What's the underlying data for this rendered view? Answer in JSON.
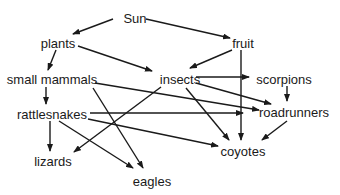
{
  "diagram": {
    "type": "food-web",
    "nodes": [
      {
        "id": "sun",
        "label": "Sun",
        "x": 135,
        "y": 18
      },
      {
        "id": "plants",
        "label": "plants",
        "x": 58,
        "y": 43
      },
      {
        "id": "fruit",
        "label": "fruit",
        "x": 243,
        "y": 43
      },
      {
        "id": "small_mammals",
        "label": "small mammals",
        "x": 52,
        "y": 79
      },
      {
        "id": "insects",
        "label": "insects",
        "x": 180,
        "y": 79
      },
      {
        "id": "scorpions",
        "label": "scorpions",
        "x": 284,
        "y": 79
      },
      {
        "id": "rattlesnakes",
        "label": "rattlesnakes",
        "x": 52,
        "y": 114
      },
      {
        "id": "roadrunners",
        "label": "roadrunners",
        "x": 294,
        "y": 112
      },
      {
        "id": "lizards",
        "label": "lizards",
        "x": 53,
        "y": 161
      },
      {
        "id": "coyotes",
        "label": "coyotes",
        "x": 243,
        "y": 151
      },
      {
        "id": "eagles",
        "label": "eagles",
        "x": 152,
        "y": 181
      }
    ],
    "edges": [
      {
        "from": "sun",
        "to": "plants",
        "x1": 113,
        "y1": 19,
        "x2": 73,
        "y2": 34
      },
      {
        "from": "sun",
        "to": "fruit",
        "x1": 146,
        "y1": 19,
        "x2": 230,
        "y2": 38
      },
      {
        "from": "plants",
        "to": "small_mammals",
        "x1": 56,
        "y1": 50,
        "x2": 48,
        "y2": 70
      },
      {
        "from": "plants",
        "to": "insects",
        "x1": 78,
        "y1": 46,
        "x2": 152,
        "y2": 71
      },
      {
        "from": "fruit",
        "to": "insects",
        "x1": 232,
        "y1": 50,
        "x2": 190,
        "y2": 68
      },
      {
        "from": "fruit",
        "to": "coyotes",
        "x1": 241,
        "y1": 50,
        "x2": 241,
        "y2": 140
      },
      {
        "from": "insects",
        "to": "scorpions",
        "x1": 196,
        "y1": 77,
        "x2": 249,
        "y2": 77
      },
      {
        "from": "insects",
        "to": "roadrunners",
        "x1": 196,
        "y1": 83,
        "x2": 271,
        "y2": 104
      },
      {
        "from": "insects",
        "to": "lizards",
        "x1": 161,
        "y1": 87,
        "x2": 74,
        "y2": 152
      },
      {
        "from": "insects",
        "to": "coyotes",
        "x1": 186,
        "y1": 88,
        "x2": 229,
        "y2": 140
      },
      {
        "from": "scorpions",
        "to": "roadrunners",
        "x1": 287,
        "y1": 86,
        "x2": 287,
        "y2": 101
      },
      {
        "from": "small_mammals",
        "to": "rattlesnakes",
        "x1": 46,
        "y1": 87,
        "x2": 46,
        "y2": 104
      },
      {
        "from": "small_mammals",
        "to": "roadrunners",
        "x1": 95,
        "y1": 83,
        "x2": 259,
        "y2": 110
      },
      {
        "from": "small_mammals",
        "to": "eagles",
        "x1": 93,
        "y1": 88,
        "x2": 143,
        "y2": 168
      },
      {
        "from": "rattlesnakes",
        "to": "roadrunners",
        "x1": 90,
        "y1": 113,
        "x2": 243,
        "y2": 113
      },
      {
        "from": "rattlesnakes",
        "to": "lizards",
        "x1": 50,
        "y1": 121,
        "x2": 50,
        "y2": 151
      },
      {
        "from": "rattlesnakes",
        "to": "eagles",
        "x1": 59,
        "y1": 121,
        "x2": 133,
        "y2": 168
      },
      {
        "from": "rattlesnakes",
        "to": "coyotes",
        "x1": 88,
        "y1": 119,
        "x2": 218,
        "y2": 146
      },
      {
        "from": "roadrunners",
        "to": "coyotes",
        "x1": 287,
        "y1": 121,
        "x2": 262,
        "y2": 140
      }
    ]
  },
  "colors": {
    "background": "#ffffff",
    "text": "#1a1a1a",
    "line": "#1a1a1a"
  }
}
